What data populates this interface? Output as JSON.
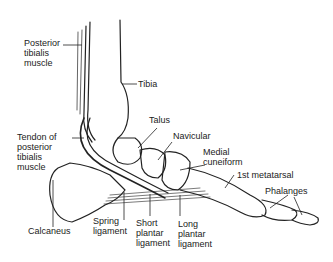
{
  "diagram": {
    "labels": {
      "posterior_tibialis_muscle": "Posterior\ntibialis\nmuscle",
      "tibia": "Tibia",
      "talus": "Talus",
      "tendon_posterior_tibialis": "Tendon of\nposterior\ntibialis\nmuscle",
      "navicular": "Navicular",
      "medial_cuneiform": "Medial\ncuneiform",
      "first_metatarsal": "1st metatarsal",
      "phalanges": "Phalanges",
      "calcaneus": "Calcaneus",
      "spring_ligament": "Spring\nligament",
      "short_plantar_ligament": "Short\nplantar\nligament",
      "long_plantar_ligament": "Long\nplantar\nligament"
    },
    "colors": {
      "line": "#222222",
      "background": "#ffffff",
      "text": "#222222"
    }
  }
}
